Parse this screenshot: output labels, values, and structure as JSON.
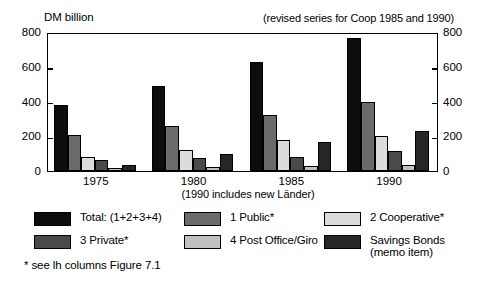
{
  "header": {
    "y_axis_unit": "DM billion",
    "revision_note": "(revised series for Coop 1985 and 1990)"
  },
  "notes": {
    "laender": "(1990 includes new Länder)",
    "footnote": "* see lh columns Figure 7.1"
  },
  "legend": {
    "items": [
      {
        "label": "Total: (1+2+3+4)",
        "sublabel": "",
        "color": "#0d0d0d"
      },
      {
        "label": "1 Public*",
        "sublabel": "",
        "color": "#6b6b6b"
      },
      {
        "label": "2 Cooperative*",
        "sublabel": "",
        "color": "#dcdcdc"
      },
      {
        "label": "3 Private*",
        "sublabel": "",
        "color": "#4a4a4a"
      },
      {
        "label": "4 Post Office/Giro",
        "sublabel": "",
        "color": "#c0c0c0"
      },
      {
        "label": "Savings Bonds",
        "sublabel": "(memo item)",
        "color": "#262626"
      }
    ]
  },
  "chart_data": {
    "type": "bar",
    "title": "",
    "subtitle": "(1990 includes new Länder)",
    "xlabel": "",
    "ylabel": "DM billion",
    "ylim": [
      0,
      800
    ],
    "yticks": [
      0,
      200,
      400,
      600,
      800
    ],
    "ytick_labels": [
      "0",
      "200",
      "400",
      "600",
      "800"
    ],
    "y_axis_right": true,
    "y_axis_right_ticks": [
      0,
      200,
      400,
      600,
      800
    ],
    "y_axis_right_labels": [
      "0",
      "200",
      "400",
      "600",
      "800"
    ],
    "grid": false,
    "legend_position": "below",
    "categories": [
      "1975",
      "1980",
      "1985",
      "1990"
    ],
    "series": [
      {
        "name": "Total: (1+2+3+4)",
        "color": "#0d0d0d",
        "values": [
          380,
          487,
          625,
          765
        ]
      },
      {
        "name": "1 Public*",
        "color": "#6b6b6b",
        "values": [
          205,
          258,
          325,
          398
        ]
      },
      {
        "name": "2 Cooperative*",
        "color": "#dcdcdc",
        "values": [
          80,
          122,
          180,
          200
        ]
      },
      {
        "name": "3 Private*",
        "color": "#4a4a4a",
        "values": [
          65,
          75,
          78,
          113
        ]
      },
      {
        "name": "4 Post Office/Giro",
        "color": "#c0c0c0",
        "values": [
          18,
          25,
          30,
          35
        ]
      },
      {
        "name": "Savings Bonds (memo item)",
        "color": "#262626",
        "values": [
          32,
          98,
          168,
          232
        ]
      }
    ]
  }
}
